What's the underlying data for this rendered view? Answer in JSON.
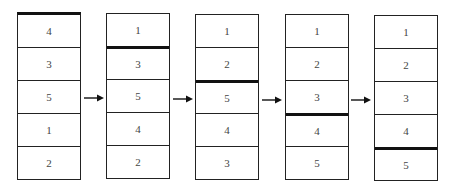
{
  "diagram": {
    "type": "sort-steps",
    "stacks": [
      {
        "cells": [
          "4",
          "3",
          "5",
          "1",
          "2"
        ],
        "divider_after": 0
      },
      {
        "cells": [
          "1",
          "3",
          "5",
          "4",
          "2"
        ],
        "divider_after": 1
      },
      {
        "cells": [
          "1",
          "2",
          "5",
          "4",
          "3"
        ],
        "divider_after": 2
      },
      {
        "cells": [
          "1",
          "2",
          "3",
          "4",
          "5"
        ],
        "divider_after": 3
      },
      {
        "cells": [
          "1",
          "2",
          "3",
          "4",
          "5"
        ],
        "divider_after": 4
      }
    ],
    "arrows": [
      "→",
      "→",
      "→",
      "→"
    ]
  }
}
